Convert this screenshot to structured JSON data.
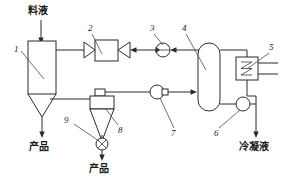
{
  "diagram": {
    "type": "process-flow-diagram",
    "stroke_color": "#2b2b2b",
    "background_color": "#ffffff",
    "text_labels": {
      "feed": "料液",
      "product_left": "产品",
      "product_bottom": "产品",
      "condensate": "冷凝液"
    },
    "callouts": [
      {
        "id": "1",
        "label": "1",
        "x": 14,
        "y": 47,
        "target": "drying-chamber"
      },
      {
        "id": "2",
        "label": "2",
        "x": 88,
        "y": 28,
        "target": "heat-exchanger-bowtie"
      },
      {
        "id": "3",
        "label": "3",
        "x": 150,
        "y": 28,
        "target": "fan-3"
      },
      {
        "id": "4",
        "label": "4",
        "x": 182,
        "y": 28,
        "target": "absorber-column"
      },
      {
        "id": "5",
        "label": "5",
        "x": 270,
        "y": 47,
        "target": "condenser"
      },
      {
        "id": "6",
        "label": "6",
        "x": 215,
        "y": 131,
        "target": "pump-6"
      },
      {
        "id": "7",
        "label": "7",
        "x": 170,
        "y": 131,
        "target": "fan-7"
      },
      {
        "id": "8",
        "label": "8",
        "x": 119,
        "y": 128,
        "target": "cyclone-separator"
      },
      {
        "id": "9",
        "label": "9",
        "x": 64,
        "y": 118,
        "target": "rotary-valve"
      }
    ],
    "equipment": [
      {
        "id": "1",
        "name": "drying-chamber",
        "description": "干燥室"
      },
      {
        "id": "2",
        "name": "heat-exchanger-bowtie",
        "description": "加热器"
      },
      {
        "id": "3",
        "name": "fan-3",
        "description": "风机"
      },
      {
        "id": "4",
        "name": "absorber-column",
        "description": "吸收塔"
      },
      {
        "id": "5",
        "name": "condenser",
        "description": "冷凝器"
      },
      {
        "id": "6",
        "name": "pump-6",
        "description": "泵"
      },
      {
        "id": "7",
        "name": "fan-7",
        "description": "风机"
      },
      {
        "id": "8",
        "name": "cyclone-separator",
        "description": "旋风分离器"
      },
      {
        "id": "9",
        "name": "rotary-valve",
        "description": "星形卸料阀"
      }
    ]
  }
}
